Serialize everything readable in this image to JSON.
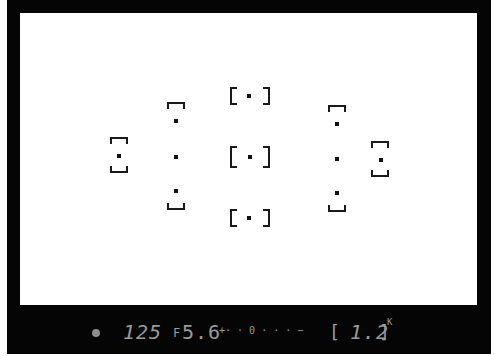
{
  "viewfinder": {
    "af_points": [
      {
        "id": "center-top",
        "x": 250,
        "y": 96
      },
      {
        "id": "center",
        "x": 250,
        "y": 157
      },
      {
        "id": "center-bottom",
        "x": 250,
        "y": 218
      },
      {
        "id": "left-inner-top",
        "x": 169,
        "y": 121
      },
      {
        "id": "left-inner-mid",
        "x": 169,
        "y": 157
      },
      {
        "id": "left-inner-bottom",
        "x": 169,
        "y": 191
      },
      {
        "id": "right-inner-top",
        "x": 330,
        "y": 124
      },
      {
        "id": "right-inner-mid",
        "x": 330,
        "y": 159
      },
      {
        "id": "right-inner-bottom",
        "x": 330,
        "y": 193
      },
      {
        "id": "left-outer",
        "x": 119,
        "y": 156
      },
      {
        "id": "right-outer",
        "x": 380,
        "y": 160
      }
    ]
  },
  "status_bar": {
    "focus_indicator": "●",
    "shutter_speed": "125",
    "aperture_prefix": "F",
    "aperture": "5.6",
    "exposure_scale": "+· · 0 · · · −",
    "bracket": "[",
    "frames_remaining": "1.2",
    "frames_suffix": "K",
    "colors": {
      "lcd": "#9a9a9a",
      "frame": "#050505"
    }
  }
}
